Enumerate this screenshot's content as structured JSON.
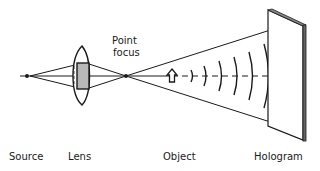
{
  "diagram": {
    "labels": {
      "source": "Source",
      "lens": "Lens",
      "point_focus_line1": "Point",
      "point_focus_line2": "focus",
      "object": "Object",
      "hologram": "Hologram"
    },
    "colors": {
      "ink": "#1a1a1a",
      "lens_shade": "#b8b8b8",
      "background": "#ffffff"
    },
    "wavefront_count": 6
  }
}
